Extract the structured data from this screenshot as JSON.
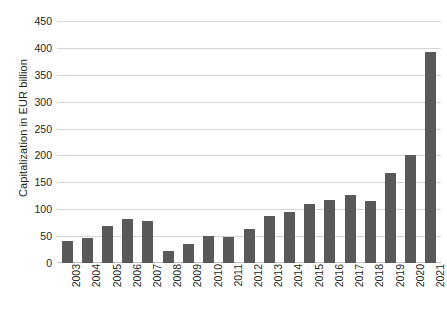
{
  "chart_data": {
    "type": "bar",
    "title": "",
    "xlabel": "",
    "ylabel": "Capitalization in EUR billion",
    "categories": [
      "2003",
      "2004",
      "2005",
      "2006",
      "2007",
      "2008",
      "2009",
      "2010",
      "2011",
      "2012",
      "2013",
      "2014",
      "2015",
      "2016",
      "2017",
      "2018",
      "2019",
      "2020",
      "2021"
    ],
    "values": [
      41,
      46,
      68,
      81,
      79,
      22,
      35,
      50,
      48,
      63,
      88,
      94,
      110,
      118,
      126,
      115,
      168,
      201,
      392
    ],
    "series": [
      {
        "name": "Capitalization",
        "values": [
          41,
          46,
          68,
          81,
          79,
          22,
          35,
          50,
          48,
          63,
          88,
          94,
          110,
          118,
          126,
          115,
          168,
          201,
          392
        ]
      }
    ],
    "ylim": [
      0,
      450
    ],
    "y_ticks": [
      0,
      50,
      100,
      150,
      200,
      250,
      300,
      350,
      400,
      450
    ],
    "y_tick_labels": [
      "0",
      "50",
      "100",
      "150",
      "200",
      "250",
      "300",
      "350",
      "400",
      "450"
    ],
    "grid": true,
    "legend": "none",
    "bar_color": "#595959",
    "grid_color": "#d4d4d4",
    "text_color": "#231f20"
  }
}
